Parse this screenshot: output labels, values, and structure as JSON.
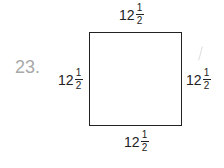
{
  "problem": {
    "number": "23.",
    "shape": "square",
    "sides": {
      "top": {
        "whole": "12",
        "num": "1",
        "den": "2"
      },
      "left": {
        "whole": "12",
        "num": "1",
        "den": "2"
      },
      "right": {
        "whole": "12",
        "num": "1",
        "den": "2"
      },
      "bottom": {
        "whole": "12",
        "num": "1",
        "den": "2"
      }
    }
  }
}
